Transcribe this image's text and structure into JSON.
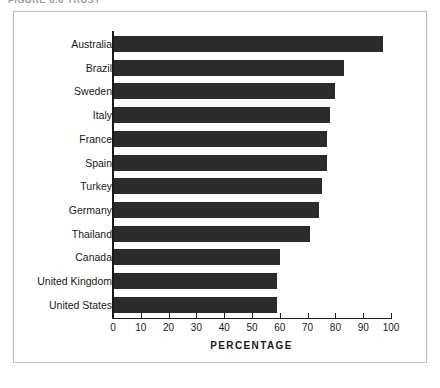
{
  "figure": {
    "caption_cropped": "FIGURE 8.8   TRUST"
  },
  "chart_data": {
    "type": "bar",
    "orientation": "horizontal",
    "title": "",
    "subtitle": "",
    "xlabel": "PERCENTAGE",
    "ylabel": "",
    "xlim": [
      0,
      100
    ],
    "xticks": [
      0,
      10,
      20,
      30,
      40,
      50,
      60,
      70,
      80,
      90,
      100
    ],
    "grid": false,
    "legend": "none",
    "bar_color": "#2b2b2b",
    "categories": [
      "Australia",
      "Brazil",
      "Sweden",
      "Italy",
      "France",
      "Spain",
      "Turkey",
      "Germany",
      "Thailand",
      "Canada",
      "United Kingdom",
      "United States"
    ],
    "values": [
      97,
      83,
      80,
      78,
      77,
      77,
      75,
      74,
      71,
      60,
      59,
      59
    ]
  }
}
